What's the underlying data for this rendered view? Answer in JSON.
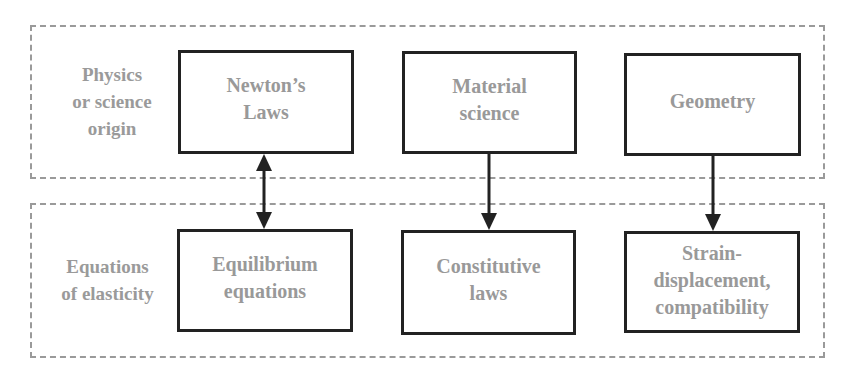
{
  "diagram": {
    "rows": [
      {
        "label": [
          "Physics",
          "or science",
          "origin"
        ],
        "boxes": [
          {
            "id": "newtons-laws",
            "lines": [
              "Newton’s",
              "Laws"
            ]
          },
          {
            "id": "material-science",
            "lines": [
              "Material",
              "science"
            ]
          },
          {
            "id": "geometry",
            "lines": [
              "Geometry"
            ]
          }
        ]
      },
      {
        "label": [
          "Equations",
          "of elasticity"
        ],
        "boxes": [
          {
            "id": "equilibrium-equations",
            "lines": [
              "Equilibrium",
              "equations"
            ]
          },
          {
            "id": "constitutive-laws",
            "lines": [
              "Constitutive",
              "laws"
            ]
          },
          {
            "id": "strain-displacement",
            "lines": [
              "Strain-",
              "displacement,",
              "compatibility"
            ]
          }
        ]
      }
    ],
    "connections": [
      {
        "from": "newtons-laws",
        "to": "equilibrium-equations",
        "type": "bidirectional"
      },
      {
        "from": "material-science",
        "to": "constitutive-laws",
        "type": "directed"
      },
      {
        "from": "geometry",
        "to": "strain-displacement",
        "type": "directed"
      }
    ],
    "colors": {
      "dashed_border": "#9a9a9a",
      "box_border": "#222222",
      "text": "#999999",
      "arrow": "#222222"
    }
  }
}
